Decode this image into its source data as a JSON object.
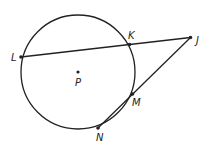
{
  "diagram": {
    "type": "circle-secants",
    "circle": {
      "center_label": "P",
      "cx": 78,
      "cy": 72,
      "r": 57
    },
    "points": {
      "L": {
        "label": "L",
        "x": 21,
        "y": 57
      },
      "K": {
        "label": "K",
        "x": 129.5,
        "y": 44.5
      },
      "J": {
        "label": "J",
        "x": 190.5,
        "y": 37.5
      },
      "M": {
        "label": "M",
        "x": 132.5,
        "y": 94
      },
      "N": {
        "label": "N",
        "x": 98,
        "y": 128
      },
      "P": {
        "label": "P",
        "x": 78,
        "y": 72
      }
    },
    "segments": [
      [
        "L",
        "J"
      ],
      [
        "N",
        "J"
      ]
    ],
    "stroke_color": "#222222"
  }
}
